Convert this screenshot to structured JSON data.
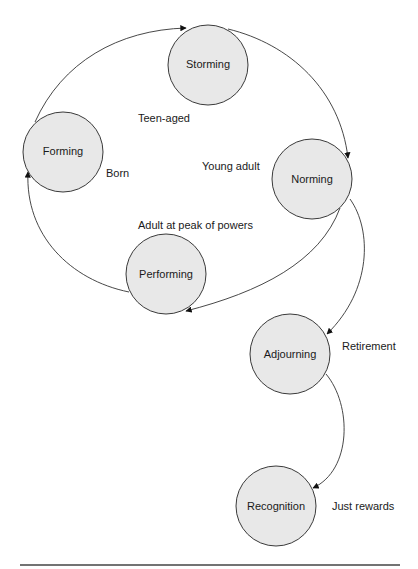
{
  "diagram": {
    "colors": {
      "node_fill": "#e8e8e8",
      "node_stroke": "#3a3a3a",
      "line": "#333333"
    },
    "nodes": [
      {
        "id": "storming",
        "label": "Storming",
        "cx": 208,
        "cy": 65,
        "r": 40
      },
      {
        "id": "forming",
        "label": "Forming",
        "cx": 63,
        "cy": 152,
        "r": 40
      },
      {
        "id": "norming",
        "label": "Norming",
        "cx": 312,
        "cy": 179,
        "r": 40
      },
      {
        "id": "performing",
        "label": "Performing",
        "cx": 166,
        "cy": 274,
        "r": 40
      },
      {
        "id": "adjourning",
        "label": "Adjourning",
        "cx": 290,
        "cy": 354,
        "r": 40
      },
      {
        "id": "recognition",
        "label": "Recognition",
        "cx": 276,
        "cy": 506,
        "r": 40
      }
    ],
    "annotations": [
      {
        "id": "born",
        "text": "Born",
        "x": 106,
        "y": 177
      },
      {
        "id": "teen-aged",
        "text": "Teen-aged",
        "x": 138,
        "y": 122
      },
      {
        "id": "young-adult",
        "text": "Young adult",
        "x": 202,
        "y": 170
      },
      {
        "id": "adult-peak",
        "text": "Adult at peak of powers",
        "x": 138,
        "y": 229
      },
      {
        "id": "retirement",
        "text": "Retirement",
        "x": 342,
        "y": 350
      },
      {
        "id": "just-rewards",
        "text": "Just rewards",
        "x": 332,
        "y": 510
      }
    ],
    "edges": [
      {
        "from": "forming",
        "to": "storming"
      },
      {
        "from": "storming",
        "to": "norming"
      },
      {
        "from": "norming",
        "to": "performing"
      },
      {
        "from": "performing",
        "to": "forming"
      },
      {
        "from": "norming",
        "to": "adjourning"
      },
      {
        "from": "adjourning",
        "to": "recognition"
      }
    ]
  }
}
